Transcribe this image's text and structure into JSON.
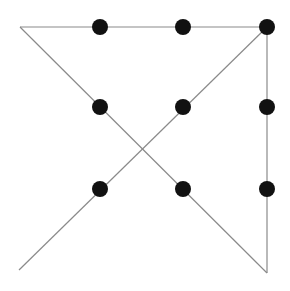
{
  "diagram": {
    "title": "",
    "width": 290,
    "height": 291,
    "background": "#ffffff",
    "line_color": "#8a8a8a",
    "line_width": 1.2,
    "dot_color": "#111111",
    "dot_radius": 8,
    "dots": [
      {
        "x": 100,
        "y": 27
      },
      {
        "x": 183,
        "y": 27
      },
      {
        "x": 267,
        "y": 27
      },
      {
        "x": 100,
        "y": 107
      },
      {
        "x": 183,
        "y": 107
      },
      {
        "x": 267,
        "y": 107
      },
      {
        "x": 100,
        "y": 189
      },
      {
        "x": 183,
        "y": 189
      },
      {
        "x": 267,
        "y": 189
      }
    ],
    "segments": [
      {
        "x1": 20,
        "y1": 27,
        "x2": 267,
        "y2": 27
      },
      {
        "x1": 267,
        "y1": 27,
        "x2": 267,
        "y2": 273
      },
      {
        "x1": 20,
        "y1": 27,
        "x2": 267,
        "y2": 273
      },
      {
        "x1": 267,
        "y1": 27,
        "x2": 19,
        "y2": 270
      }
    ]
  }
}
